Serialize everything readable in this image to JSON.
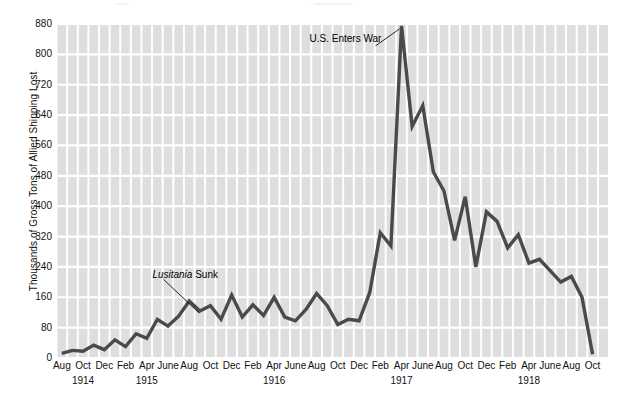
{
  "chart_data": {
    "type": "line",
    "title": "",
    "xlabel": "",
    "ylabel": "Thousands of Gross Tons of Allied Shipping Lost",
    "ylim": [
      0,
      880
    ],
    "yticks": [
      0,
      80,
      160,
      240,
      320,
      400,
      480,
      560,
      640,
      720,
      800,
      880
    ],
    "grid": true,
    "legend": "none",
    "xtick_labels": [
      "Aug",
      "Oct",
      "Dec",
      "Feb",
      "Apr",
      "June",
      "Aug",
      "Oct",
      "Dec",
      "Feb",
      "Apr",
      "June",
      "Aug",
      "Oct",
      "Dec",
      "Feb",
      "Apr",
      "June",
      "Aug",
      "Oct",
      "Dec",
      "Feb",
      "Apr",
      "June",
      "Aug",
      "Oct"
    ],
    "year_labels": [
      {
        "label": "1914",
        "at_index": 2
      },
      {
        "label": "1915",
        "at_index": 8
      },
      {
        "label": "1916",
        "at_index": 20
      },
      {
        "label": "1917",
        "at_index": 32
      },
      {
        "label": "1918",
        "at_index": 44
      }
    ],
    "x": [
      "1914-08",
      "1914-09",
      "1914-10",
      "1914-11",
      "1914-12",
      "1915-01",
      "1915-02",
      "1915-03",
      "1915-04",
      "1915-05",
      "1915-06",
      "1915-07",
      "1915-08",
      "1915-09",
      "1915-10",
      "1915-11",
      "1915-12",
      "1916-01",
      "1916-02",
      "1916-03",
      "1916-04",
      "1916-05",
      "1916-06",
      "1916-07",
      "1916-08",
      "1916-09",
      "1916-10",
      "1916-11",
      "1916-12",
      "1917-01",
      "1917-02",
      "1917-03",
      "1917-04",
      "1917-05",
      "1917-06",
      "1917-07",
      "1917-08",
      "1917-09",
      "1917-10",
      "1917-11",
      "1917-12",
      "1918-01",
      "1918-02",
      "1918-03",
      "1918-04",
      "1918-05",
      "1918-06",
      "1918-07",
      "1918-08",
      "1918-09",
      "1918-10"
    ],
    "values": [
      12,
      20,
      18,
      34,
      22,
      48,
      30,
      64,
      52,
      102,
      84,
      110,
      150,
      124,
      138,
      102,
      166,
      108,
      140,
      112,
      160,
      108,
      98,
      128,
      170,
      138,
      88,
      102,
      98,
      172,
      330,
      295,
      875,
      610,
      665,
      490,
      440,
      310,
      425,
      240,
      385,
      360,
      290,
      325,
      250,
      260,
      230,
      200,
      215,
      160,
      10
    ],
    "annotations": [
      {
        "name": "lusitania-sunk",
        "text_italic": "Lusitania",
        "text_plain": " Sunk",
        "points_to": "1915-05"
      },
      {
        "name": "us-enters-war",
        "text_italic": "",
        "text_plain": "U.S. Enters War",
        "points_to": "1917-04"
      }
    ]
  },
  "axis": {
    "y_title": "Thousands of Gross Tons of Allied Shipping Lost"
  },
  "colors": {
    "plot_background": "#dedede",
    "gridline": "#ffffff",
    "line": "#4a4a4a",
    "text": "#111111"
  }
}
